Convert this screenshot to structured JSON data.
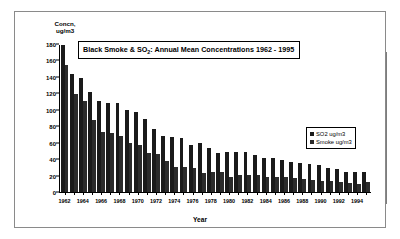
{
  "chart_data": {
    "type": "bar",
    "title": "Black Smoke & SO2: Annual Mean Concentrations 1962 - 1995",
    "title_parts": {
      "prefix": "Black Smoke & SO",
      "sub": "2",
      "suffix": ": Annual Mean Concentrations 1962 - 1995"
    },
    "xlabel": "Year",
    "ylabel": "Concn,\nug/m3",
    "ylim": [
      0,
      180
    ],
    "yticks": [
      0,
      20,
      40,
      60,
      80,
      100,
      120,
      140,
      160,
      180
    ],
    "grid": false,
    "legend_position": "right",
    "categories": [
      "1962",
      "1963",
      "1964",
      "1965",
      "1966",
      "1967",
      "1968",
      "1969",
      "1970",
      "1971",
      "1972",
      "1973",
      "1974",
      "1975",
      "1976",
      "1977",
      "1978",
      "1979",
      "1980",
      "1981",
      "1982",
      "1983",
      "1984",
      "1985",
      "1986",
      "1987",
      "1988",
      "1989",
      "1990",
      "1991",
      "1992",
      "1993",
      "1994",
      "1995"
    ],
    "tick_labels": [
      "1962",
      "",
      "1964",
      "",
      "1966",
      "",
      "1968",
      "",
      "1970",
      "",
      "1972",
      "",
      "1974",
      "",
      "1976",
      "",
      "1978",
      "",
      "1980",
      "",
      "1982",
      "",
      "1984",
      "",
      "1986",
      "",
      "1988",
      "",
      "1990",
      "",
      "1992",
      "",
      "1994",
      ""
    ],
    "series": [
      {
        "name": "SO2 ug/m3",
        "color": "#1a1a1a",
        "values": [
          180,
          145,
          140,
          122,
          111,
          109,
          109,
          101,
          98,
          90,
          77,
          68,
          67,
          66,
          57,
          60,
          54,
          48,
          49,
          49,
          49,
          45,
          42,
          42,
          39,
          37,
          35,
          34,
          33,
          29,
          28,
          25,
          24,
          24
        ]
      },
      {
        "name": "Smoke ug/m3",
        "color": "#2b2b2b",
        "values": [
          156,
          120,
          111,
          88,
          74,
          72,
          69,
          60,
          57,
          48,
          46,
          38,
          31,
          31,
          30,
          23,
          25,
          24,
          18,
          21,
          21,
          21,
          18,
          18,
          18,
          17,
          16,
          15,
          14,
          14,
          12,
          11,
          10,
          12
        ]
      }
    ]
  },
  "legend": {
    "items": [
      {
        "label": "SO2 ug/m3"
      },
      {
        "label": "Smoke ug/m3"
      }
    ]
  }
}
